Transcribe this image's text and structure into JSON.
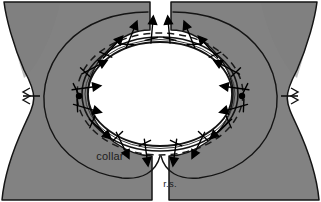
{
  "figure": {
    "type": "sewing-pattern-illustration",
    "width": 321,
    "height": 202,
    "background_color": "#ffffff",
    "fabric_color": "#828282",
    "fabric_color_shadow": "#777777",
    "outline_color": "#111111",
    "stitch_line_color": "#1a1a1a",
    "pin_color": "#000000"
  },
  "labels": [
    {
      "id": "collar",
      "text": "collar",
      "x": 110,
      "y": 160,
      "anchor": "middle",
      "style": "label-text"
    },
    {
      "id": "right-side",
      "text": "r.s.",
      "x": 170,
      "y": 187,
      "anchor": "middle",
      "style": "label-rs"
    }
  ],
  "pieces": {
    "bodice": {
      "name": "bodice-garment-body",
      "description": "Large gray garment body with concave side edges and a wide oval neckline opening",
      "fill": "#828282"
    },
    "collar_left": {
      "name": "collar-left-half",
      "description": "Left comma-shaped collar outline drawn on the bodice"
    },
    "collar_right": {
      "name": "collar-right-half",
      "description": "Right comma-shaped collar outline drawn on the bodice"
    }
  },
  "neckline": {
    "name": "neckline-opening",
    "shape": "oval",
    "center_x": 160,
    "center_y": 94,
    "radius_x": 72,
    "radius_y": 52
  },
  "seam_allowance": {
    "name": "seam-allowance-dashed-line",
    "style": "dashed",
    "dash_pattern": "6 4"
  },
  "pins": {
    "count": 14,
    "description": "Straight pins placed perpendicular across the neckline seam, heads alternating inside and outside",
    "angles_deg": [
      200,
      222,
      244,
      266,
      288,
      310,
      332,
      28,
      50,
      72,
      94,
      116,
      138,
      160
    ]
  },
  "notches": [
    {
      "id": "left-shoulder-notch",
      "x": 22,
      "y": 98,
      "description": "Zig-zag notch mark at left side edge"
    },
    {
      "id": "right-shoulder-notch",
      "x": 299,
      "y": 98,
      "description": "Zig-zag notch mark at right side edge"
    }
  ],
  "match_points": [
    {
      "id": "left-match-dot",
      "x": 79,
      "y": 96
    },
    {
      "id": "right-match-dot",
      "x": 241,
      "y": 96
    }
  ]
}
